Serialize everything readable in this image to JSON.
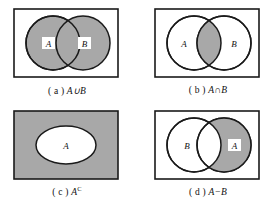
{
  "figure": {
    "colors": {
      "shade": "#a8a8a8",
      "white": "#ffffff",
      "stroke": "#1a1a1a",
      "background": "#ffffff"
    },
    "panels": [
      {
        "id": "a",
        "caption_index": "( a )",
        "caption_expr": "A∪B",
        "operation": "union",
        "shaded_region": "both circles entirely, including overlap",
        "set_labels": [
          "A",
          "B"
        ],
        "label_boxes": true,
        "shape": "two-overlapping-circles",
        "container": "rectangle"
      },
      {
        "id": "b",
        "caption_index": "( b )",
        "caption_expr": "A∩B",
        "operation": "intersection",
        "shaded_region": "lens overlap of the two circles only",
        "set_labels": [
          "A",
          "B"
        ],
        "label_boxes": false,
        "shape": "two-overlapping-circles",
        "container": "rectangle"
      },
      {
        "id": "c",
        "caption_index": "( c )",
        "caption_expr": "A",
        "caption_superscript": "C",
        "operation": "complement",
        "shaded_region": "rectangle outside the ellipse",
        "set_labels": [
          "A"
        ],
        "label_boxes": false,
        "shape": "single-ellipse",
        "container": "rectangle"
      },
      {
        "id": "d",
        "caption_index": "( d )",
        "caption_expr": "A−B",
        "operation": "difference",
        "shaded_region": "right circle A excluding the overlap with B",
        "set_labels": [
          "B",
          "A"
        ],
        "label_boxes": true,
        "shape": "two-overlapping-circles",
        "container": "rectangle"
      }
    ]
  }
}
